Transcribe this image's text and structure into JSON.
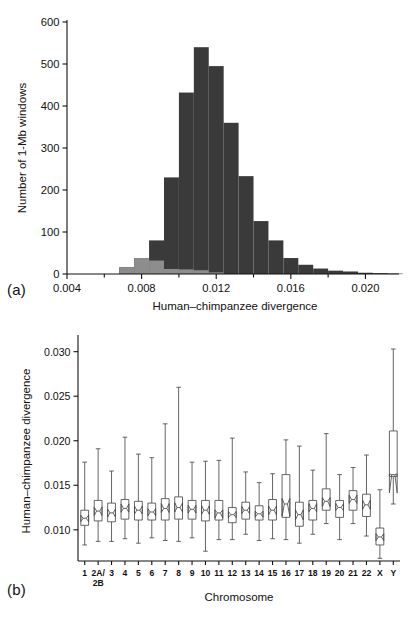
{
  "figure": {
    "panel_a_label": "(a)",
    "panel_b_label": "(b)"
  },
  "chart_data": [
    {
      "type": "bar",
      "panel": "(a)",
      "title": "",
      "xlabel": "Human–chimpanzee divergence",
      "ylabel": "Number of 1-Mb windows",
      "xlim": [
        0.004,
        0.0218
      ],
      "ylim": [
        0,
        600
      ],
      "ytick_labels": [
        "0",
        "100",
        "200",
        "300",
        "400",
        "500",
        "600"
      ],
      "ytick_values": [
        0,
        100,
        200,
        300,
        400,
        500,
        600
      ],
      "xtick_labels": [
        "0.004",
        "0.008",
        "0.012",
        "0.016",
        "0.020"
      ],
      "xtick_values": [
        0.004,
        0.008,
        0.012,
        0.016,
        0.02
      ],
      "xminor_values": [
        0.006,
        0.01,
        0.014,
        0.018,
        0.022
      ],
      "grid": false,
      "legend": "none",
      "bin_width": 0.0008,
      "series": [
        {
          "name": "Autosomal 1-Mb windows",
          "color": "#3a3a3a",
          "bin_starts": [
            0.0068,
            0.0076,
            0.0084,
            0.0092,
            0.01,
            0.0108,
            0.0116,
            0.0124,
            0.0132,
            0.014,
            0.0148,
            0.0156,
            0.0164,
            0.0172,
            0.018,
            0.0188,
            0.0196,
            0.0204,
            0.0212
          ],
          "values": [
            16,
            38,
            80,
            230,
            432,
            540,
            495,
            360,
            233,
            126,
            80,
            38,
            22,
            13,
            8,
            6,
            3,
            2,
            1
          ]
        },
        {
          "name": "X-chromosome 1-Mb windows",
          "color": "#8d8d8d",
          "bin_starts": [
            0.0068,
            0.0076,
            0.0084,
            0.0092,
            0.01,
            0.0108,
            0.0116
          ],
          "values": [
            16,
            38,
            32,
            12,
            11,
            9,
            4
          ]
        }
      ]
    },
    {
      "type": "boxplot",
      "panel": "(b)",
      "title": "",
      "xlabel": "Chromosome",
      "ylabel": "Human–chimpanzee divergence",
      "ylim": [
        0.0065,
        0.0312
      ],
      "ytick_labels": [
        "0.010",
        "0.015",
        "0.020",
        "0.025",
        "0.030"
      ],
      "ytick_values": [
        0.01,
        0.015,
        0.02,
        0.025,
        0.03
      ],
      "grid": false,
      "legend": "none",
      "notched": true,
      "categories": [
        "1",
        "2A/\n2B",
        "3",
        "4",
        "5",
        "6",
        "7",
        "8",
        "9",
        "10",
        "11",
        "12",
        "13",
        "14",
        "15",
        "16",
        "17",
        "18",
        "19",
        "20",
        "21",
        "22",
        "X",
        "Y"
      ],
      "boxes": [
        {
          "chromosome": "1",
          "low": 0.0083,
          "q1": 0.0105,
          "median": 0.0113,
          "q3": 0.0122,
          "high": 0.0176
        },
        {
          "chromosome": "2A/2B",
          "low": 0.0087,
          "q1": 0.011,
          "median": 0.0121,
          "q3": 0.0133,
          "high": 0.0191
        },
        {
          "chromosome": "3",
          "low": 0.0087,
          "q1": 0.0109,
          "median": 0.0119,
          "q3": 0.013,
          "high": 0.0166
        },
        {
          "chromosome": "4",
          "low": 0.009,
          "q1": 0.0112,
          "median": 0.0124,
          "q3": 0.0134,
          "high": 0.0204
        },
        {
          "chromosome": "5",
          "low": 0.0085,
          "q1": 0.0111,
          "median": 0.0122,
          "q3": 0.0132,
          "high": 0.0185
        },
        {
          "chromosome": "6",
          "low": 0.0091,
          "q1": 0.0111,
          "median": 0.012,
          "q3": 0.013,
          "high": 0.0181
        },
        {
          "chromosome": "7",
          "low": 0.0088,
          "q1": 0.0111,
          "median": 0.0124,
          "q3": 0.0135,
          "high": 0.0219
        },
        {
          "chromosome": "8",
          "low": 0.0087,
          "q1": 0.0112,
          "median": 0.0125,
          "q3": 0.0137,
          "high": 0.026
        },
        {
          "chromosome": "9",
          "low": 0.0091,
          "q1": 0.0112,
          "median": 0.0123,
          "q3": 0.0133,
          "high": 0.0176
        },
        {
          "chromosome": "10",
          "low": 0.0076,
          "q1": 0.011,
          "median": 0.0122,
          "q3": 0.0133,
          "high": 0.0177
        },
        {
          "chromosome": "11",
          "low": 0.0089,
          "q1": 0.0111,
          "median": 0.0119,
          "q3": 0.0133,
          "high": 0.0178
        },
        {
          "chromosome": "12",
          "low": 0.0089,
          "q1": 0.0108,
          "median": 0.0117,
          "q3": 0.0125,
          "high": 0.0203
        },
        {
          "chromosome": "13",
          "low": 0.0095,
          "q1": 0.0112,
          "median": 0.0122,
          "q3": 0.0131,
          "high": 0.0165
        },
        {
          "chromosome": "14",
          "low": 0.0088,
          "q1": 0.0111,
          "median": 0.0118,
          "q3": 0.0127,
          "high": 0.0153
        },
        {
          "chromosome": "15",
          "low": 0.009,
          "q1": 0.0111,
          "median": 0.0122,
          "q3": 0.0134,
          "high": 0.0163
        },
        {
          "chromosome": "16",
          "low": 0.0089,
          "q1": 0.0114,
          "median": 0.0129,
          "q3": 0.0162,
          "high": 0.0201
        },
        {
          "chromosome": "17",
          "low": 0.0085,
          "q1": 0.0104,
          "median": 0.0117,
          "q3": 0.0131,
          "high": 0.0194
        },
        {
          "chromosome": "18",
          "low": 0.0095,
          "q1": 0.0111,
          "median": 0.0124,
          "q3": 0.0133,
          "high": 0.0167
        },
        {
          "chromosome": "19",
          "low": 0.0107,
          "q1": 0.0122,
          "median": 0.0132,
          "q3": 0.0146,
          "high": 0.0208
        },
        {
          "chromosome": "20",
          "low": 0.0089,
          "q1": 0.0114,
          "median": 0.0125,
          "q3": 0.0133,
          "high": 0.0162
        },
        {
          "chromosome": "21",
          "low": 0.0107,
          "q1": 0.0122,
          "median": 0.0134,
          "q3": 0.0144,
          "high": 0.017
        },
        {
          "chromosome": "22",
          "low": 0.0093,
          "q1": 0.0115,
          "median": 0.0128,
          "q3": 0.014,
          "high": 0.0184
        },
        {
          "chromosome": "X",
          "low": 0.0068,
          "q1": 0.0083,
          "median": 0.0092,
          "q3": 0.0102,
          "high": 0.0145
        },
        {
          "chromosome": "Y",
          "low": 0.0129,
          "q1": 0.016,
          "median": 0.0162,
          "q3": 0.0211,
          "high": 0.0303
        }
      ]
    }
  ]
}
